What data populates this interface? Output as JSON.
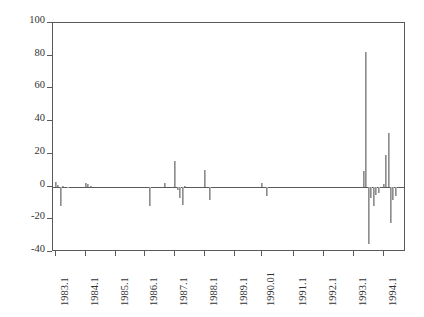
{
  "chart_data": {
    "type": "bar",
    "title": "",
    "subtitle": "",
    "xlabel": "",
    "ylabel": "",
    "grid": false,
    "legend": "none",
    "ylim": [
      -40,
      100
    ],
    "y_ticks": [
      -40,
      -20,
      0,
      20,
      40,
      60,
      80,
      100
    ],
    "y_tick_labels": [
      "-40",
      "-20",
      "0",
      "20",
      "40",
      "60",
      "80",
      "100"
    ],
    "xlim": [
      1983.0,
      1994.85
    ],
    "x_ticks": [
      1983.1,
      1984.1,
      1985.1,
      1986.1,
      1987.1,
      1988.1,
      1989.1,
      1990.01,
      1991.1,
      1992.1,
      1993.1,
      1994.1
    ],
    "x_tick_labels": [
      "1983.1",
      "1984.1",
      "1985.1",
      "1986.1",
      "1987.1",
      "1988.1",
      "1989.1",
      "1990.01",
      "1991.1",
      "1992.1",
      "1993.1",
      "1994.1"
    ],
    "bar_color": "#9a9a9a",
    "axis_color": "#5a5a5a",
    "zero_line": 0,
    "x": [
      1983.1,
      1983.18,
      1983.27,
      1983.35,
      1983.43,
      1983.52,
      1983.6,
      1983.68,
      1983.77,
      1983.85,
      1983.93,
      1984.1,
      1984.18,
      1984.27,
      1984.35,
      1984.43,
      1984.52,
      1984.6,
      1984.68,
      1984.77,
      1984.85,
      1984.93,
      1985.1,
      1985.18,
      1985.27,
      1985.35,
      1985.43,
      1985.52,
      1985.6,
      1985.68,
      1985.77,
      1985.85,
      1985.93,
      1986.1,
      1986.18,
      1986.27,
      1986.35,
      1986.43,
      1986.52,
      1986.6,
      1986.68,
      1986.77,
      1986.85,
      1986.93,
      1987.1,
      1987.18,
      1987.27,
      1987.35,
      1987.43,
      1987.52,
      1987.6,
      1987.68,
      1987.77,
      1987.85,
      1987.93,
      1988.1,
      1988.18,
      1988.27,
      1988.35,
      1988.43,
      1988.52,
      1988.6,
      1988.68,
      1988.77,
      1988.85,
      1988.93,
      1989.1,
      1989.18,
      1989.27,
      1989.35,
      1989.43,
      1989.52,
      1989.6,
      1989.68,
      1989.77,
      1989.85,
      1989.93,
      1990.01,
      1990.18,
      1990.27,
      1990.35,
      1990.43,
      1990.52,
      1990.6,
      1990.68,
      1990.77,
      1990.85,
      1990.93,
      1991.1,
      1991.18,
      1991.27,
      1991.35,
      1991.43,
      1991.52,
      1991.6,
      1991.68,
      1991.77,
      1991.85,
      1991.93,
      1992.1,
      1992.18,
      1992.27,
      1992.35,
      1992.43,
      1992.52,
      1992.6,
      1992.68,
      1992.77,
      1992.85,
      1992.93,
      1993.1,
      1993.18,
      1993.27,
      1993.35,
      1993.43,
      1993.52,
      1993.6,
      1993.68,
      1993.77,
      1993.85,
      1993.93,
      1994.1,
      1994.18,
      1994.27,
      1994.35,
      1994.43,
      1994.52,
      1994.6,
      1994.68,
      1994.77
    ],
    "values": [
      2.5,
      1.0,
      -12.0,
      0.5,
      0.0,
      -0.5,
      0.0,
      0.0,
      0.0,
      0.0,
      0.0,
      2.0,
      1.5,
      0.5,
      0.0,
      0.0,
      0.0,
      0.0,
      0.0,
      0.0,
      0.0,
      0.0,
      0.0,
      0.0,
      0.0,
      0.0,
      0.0,
      0.0,
      0.0,
      0.0,
      0.0,
      0.0,
      0.0,
      0.0,
      0.0,
      -12.0,
      0.0,
      0.0,
      0.0,
      0.0,
      0.0,
      2.0,
      0.0,
      0.0,
      15.5,
      -2.0,
      -7.0,
      -11.5,
      0.5,
      0.0,
      0.0,
      0.0,
      0.0,
      0.0,
      0.0,
      10.0,
      0.0,
      -8.0,
      0.0,
      0.0,
      0.0,
      0.0,
      0.0,
      0.0,
      0.0,
      0.0,
      0.0,
      0.0,
      0.0,
      0.0,
      0.0,
      0.0,
      0.0,
      0.0,
      0.0,
      0.0,
      0.0,
      2.0,
      -6.0,
      0.0,
      0.0,
      0.0,
      0.0,
      0.0,
      0.0,
      0.0,
      0.0,
      0.0,
      0.0,
      0.0,
      0.0,
      0.0,
      0.0,
      0.0,
      0.0,
      0.0,
      0.0,
      0.0,
      0.0,
      0.0,
      0.0,
      0.0,
      0.0,
      0.0,
      0.0,
      0.0,
      0.0,
      0.0,
      0.0,
      0.0,
      0.0,
      0.0,
      0.0,
      0.0,
      9.5,
      82.0,
      -35.0,
      -7.0,
      -12.0,
      -5.0,
      -4.0,
      1.5,
      19.5,
      33.0,
      -22.0,
      -8.0,
      -6.0,
      0.0,
      0.0,
      0.0
    ]
  }
}
